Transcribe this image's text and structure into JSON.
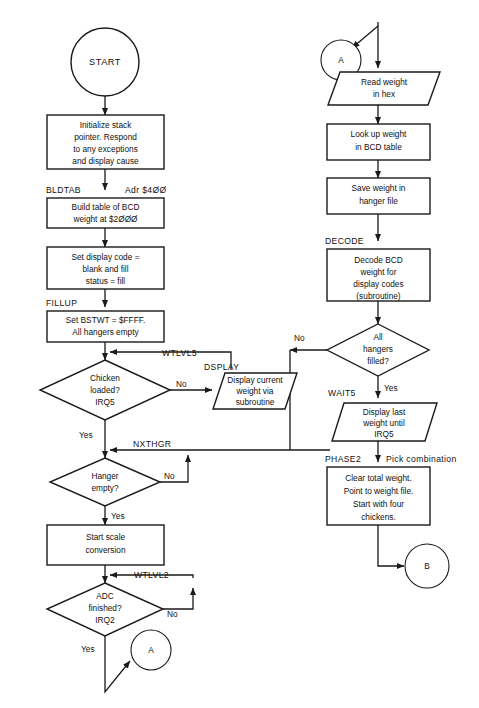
{
  "diagram": {
    "type": "flowchart",
    "colors": {
      "background": "#ffffff",
      "stroke": "#1a1a1a",
      "text": "#111111"
    },
    "nodes": {
      "start": {
        "label": "START",
        "shape": "terminator-circle"
      },
      "init": {
        "line1": "Initialize stack",
        "line2": "pointer. Respond",
        "line3": "to any exceptions",
        "line4": "and display cause",
        "shape": "process"
      },
      "bldtab": {
        "line1": "Build table of BCD",
        "line2": "weight at $2ØØØ",
        "shape": "process"
      },
      "setdisp": {
        "line1": "Set display code =",
        "line2": "blank and fill",
        "line3": "status = fill",
        "shape": "process"
      },
      "fillup": {
        "line1": "Set BSTWT = $FFFF.",
        "line2": "All hangers empty",
        "shape": "process"
      },
      "chicken": {
        "line1": "Chicken",
        "line2": "loaded?",
        "line3": "IRQ5",
        "shape": "decision"
      },
      "dsplay": {
        "line1": "Display current",
        "line2": "weight via",
        "line3": "subroutine",
        "shape": "input-output"
      },
      "hanger": {
        "line1": "Hanger",
        "line2": "empty?",
        "shape": "decision"
      },
      "startscale": {
        "line1": "Start scale",
        "line2": "conversion",
        "shape": "process"
      },
      "adc": {
        "line1": "ADC",
        "line2": "finished?",
        "line3": "IRQ2",
        "shape": "decision"
      },
      "conn_a_bottom": {
        "label": "A",
        "shape": "connector"
      },
      "conn_a_top": {
        "label": "A",
        "shape": "connector"
      },
      "readweight": {
        "line1": "Read weight",
        "line2": "in hex",
        "shape": "input-output"
      },
      "lookup": {
        "line1": "Look up weight",
        "line2": "in BCD table",
        "shape": "process"
      },
      "saveweight": {
        "line1": "Save weight in",
        "line2": "hanger file",
        "shape": "process"
      },
      "decode": {
        "line1": "Decode BCD",
        "line2": "weight for",
        "line3": "display codes",
        "line4": "(subroutine)",
        "shape": "process"
      },
      "allhangers": {
        "line1": "All",
        "line2": "hangers",
        "line3": "filled?",
        "shape": "decision"
      },
      "wait5": {
        "line1": "Display last",
        "line2": "weight until",
        "line3": "IRQ5",
        "shape": "input-output"
      },
      "phase2box": {
        "line1": "Clear total weight.",
        "line2": "Point to weight file.",
        "line3": "Start with four",
        "line4": "chickens.",
        "shape": "process"
      },
      "conn_b": {
        "label": "B",
        "shape": "connector"
      }
    },
    "labels": {
      "bldtab": "BLDTAB",
      "adr400": "Adr $4ØØ",
      "fillup": "FILLUP",
      "wtlvl5": "WTLVL5",
      "dsplay": "DSPLAY",
      "nxthgr": "NXTHGR",
      "wtlvl2": "WTLVL2",
      "intrp2": "INTRP2",
      "decode": "DECODE",
      "wait5": "WAIT5",
      "phase2": "PHASE2",
      "pickcomb": "Pick combination"
    },
    "edges": {
      "chicken_no": "No",
      "chicken_yes": "Yes",
      "hanger_no": "No",
      "hanger_yes": "Yes",
      "adc_no": "No",
      "adc_yes": "Yes",
      "allhangers_no": "No",
      "allhangers_yes": "Yes"
    }
  }
}
